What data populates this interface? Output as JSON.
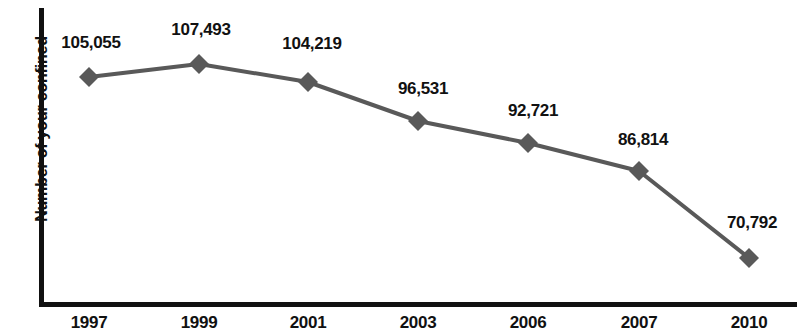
{
  "chart_data": {
    "type": "line",
    "title": "",
    "xlabel": "",
    "ylabel": "Number of your confined",
    "categories": [
      "1997",
      "1999",
      "2001",
      "2003",
      "2006",
      "2007",
      "2010"
    ],
    "values": [
      105055,
      107493,
      104219,
      96531,
      92721,
      86814,
      70792
    ],
    "value_labels": [
      "105,055",
      "107,493",
      "104,219",
      "96,531",
      "92,721",
      "86,814",
      "70,792"
    ],
    "series": [
      {
        "name": "Number of your confined",
        "values": [
          105055,
          107493,
          104219,
          96531,
          92721,
          86814,
          70792
        ]
      }
    ],
    "points": [
      {
        "category": "1997",
        "value": 105055,
        "label": "105,055",
        "x": 89,
        "y": 77,
        "label_x": 91,
        "label_y": 33
      },
      {
        "category": "1999",
        "value": 107493,
        "label": "107,493",
        "x": 199,
        "y": 64,
        "label_x": 201,
        "label_y": 20
      },
      {
        "category": "2001",
        "value": 104219,
        "label": "104,219",
        "x": 308,
        "y": 82,
        "label_x": 312,
        "label_y": 34
      },
      {
        "category": "2003",
        "value": 96531,
        "label": "96,531",
        "x": 418,
        "y": 121,
        "label_x": 423,
        "label_y": 79
      },
      {
        "category": "2006",
        "value": 92721,
        "label": "92,721",
        "x": 528,
        "y": 143,
        "label_x": 533,
        "label_y": 101
      },
      {
        "category": "2007",
        "value": 86814,
        "label": "86,814",
        "x": 639,
        "y": 171,
        "label_x": 643,
        "label_y": 130
      },
      {
        "category": "2010",
        "value": 70792,
        "label": "70,792",
        "x": 749,
        "y": 258,
        "label_x": 752,
        "label_y": 213
      }
    ],
    "tick_positions": [
      89,
      199,
      308,
      418,
      528,
      639,
      749
    ],
    "ylim": [
      60000,
      115000
    ],
    "grid": false,
    "legend": false,
    "marker": "diamond",
    "colors": {
      "line": "#595959",
      "marker": "#595959",
      "axis": "#111111",
      "text": "#111111",
      "background": "#ffffff"
    }
  }
}
